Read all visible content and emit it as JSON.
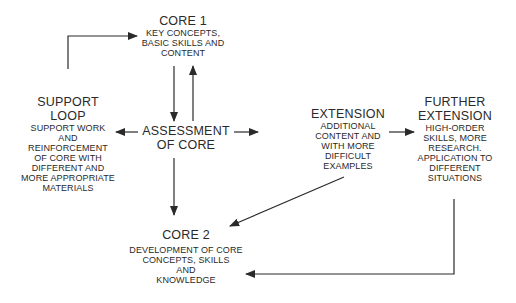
{
  "diagram": {
    "nodes": {
      "core1": {
        "title": "CORE 1",
        "lines": [
          "KEY CONCEPTS,",
          "BASIC SKILLS AND",
          "CONTENT"
        ]
      },
      "support": {
        "title_lines": [
          "SUPPORT",
          "LOOP"
        ],
        "lines": [
          "SUPPORT WORK",
          "AND",
          "REINFORCEMENT",
          "OF CORE WITH",
          "DIFFERENT AND",
          "MORE APPROPRIATE",
          "MATERIALS"
        ]
      },
      "assessment": {
        "title_lines": [
          "ASSESSMENT",
          "OF CORE"
        ]
      },
      "extension": {
        "title": "EXTENSION",
        "lines": [
          "ADDITIONAL",
          "CONTENT AND",
          "WITH MORE",
          "DIFFICULT",
          "EXAMPLES"
        ]
      },
      "further": {
        "title_lines": [
          "FURTHER",
          "EXTENSION"
        ],
        "lines": [
          "HIGH-ORDER",
          "SKILLS, MORE",
          "RESEARCH.",
          "APPLICATION TO",
          "DIFFERENT",
          "SITUATIONS"
        ]
      },
      "core2": {
        "title": "CORE 2",
        "lines": [
          "DEVELOPMENT OF CORE",
          "CONCEPTS, SKILLS",
          "AND",
          "KNOWLEDGE"
        ]
      }
    },
    "edges": [
      {
        "from": "support",
        "to": "core1"
      },
      {
        "from": "core1",
        "to": "assessment"
      },
      {
        "from": "assessment",
        "to": "core1"
      },
      {
        "from": "assessment",
        "to": "support"
      },
      {
        "from": "assessment",
        "to": "extension"
      },
      {
        "from": "extension",
        "to": "further"
      },
      {
        "from": "assessment",
        "to": "core2"
      },
      {
        "from": "extension",
        "to": "core2"
      },
      {
        "from": "further",
        "to": "core2"
      }
    ],
    "colors": {
      "line": "#2a2a2a",
      "text": "#2a2a2a",
      "background": "#ffffff"
    }
  }
}
